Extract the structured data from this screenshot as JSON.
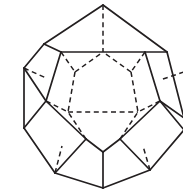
{
  "figure": {
    "shape_name": "dodecahedron",
    "view": "face-on front pentagon view",
    "background_color": "#ffffff",
    "line_color": "#231f20",
    "visible_edge_style": "solid",
    "hidden_edge_style": "dashed",
    "face_count": 12,
    "vertex_count": 20,
    "edge_count": 30,
    "canvas": {
      "width": 183,
      "height": 195
    },
    "clipping_note": "right silhouette extends past the right image border",
    "geometry": {
      "outer_silhouette": [
        [
          103,
          5
        ],
        [
          167,
          52
        ],
        [
          184,
          128
        ],
        [
          133,
          178
        ],
        [
          103,
          188
        ],
        [
          55,
          173
        ],
        [
          24,
          128
        ],
        [
          24,
          68
        ]
      ],
      "front_face_ring": [
        [
          103,
          52
        ],
        [
          145,
          84
        ],
        [
          129,
          133
        ],
        [
          77,
          133
        ],
        [
          61,
          84
        ]
      ],
      "visible_edges": [
        {
          "from": [
            103,
            5
          ],
          "to": [
            167,
            52
          ],
          "name": "silhouette-top-right"
        },
        {
          "from": [
            167,
            52
          ],
          "to": [
            184,
            118
          ],
          "name": "silhouette-right-upper"
        },
        {
          "from": [
            103,
            5
          ],
          "to": [
            44,
            44
          ],
          "name": "silhouette-top-left"
        },
        {
          "from": [
            44,
            44
          ],
          "to": [
            24,
            68
          ],
          "name": "silhouette-upper-left"
        },
        {
          "from": [
            24,
            68
          ],
          "to": [
            24,
            128
          ],
          "name": "silhouette-left-vertical"
        },
        {
          "from": [
            24,
            128
          ],
          "to": [
            55,
            173
          ],
          "name": "silhouette-lower-left"
        },
        {
          "from": [
            55,
            173
          ],
          "to": [
            103,
            188
          ],
          "name": "silhouette-bottom-left"
        },
        {
          "from": [
            103,
            188
          ],
          "to": [
            150,
            170
          ],
          "name": "silhouette-bottom-right"
        },
        {
          "from": [
            150,
            170
          ],
          "to": [
            184,
            130
          ],
          "name": "silhouette-right-lower"
        },
        {
          "from": [
            61,
            52
          ],
          "to": [
            145,
            52
          ],
          "name": "front-pentagon-top"
        },
        {
          "from": [
            145,
            52
          ],
          "to": [
            160,
            101
          ],
          "name": "front-pentagon-upper-right"
        },
        {
          "from": [
            160,
            101
          ],
          "to": [
            120,
            139
          ],
          "name": "front-pentagon-lower-right"
        },
        {
          "from": [
            120,
            139
          ],
          "to": [
            103,
            152
          ],
          "name": "front-pentagon-bottom-right"
        },
        {
          "from": [
            103,
            152
          ],
          "to": [
            86,
            139
          ],
          "name": "front-pentagon-bottom-left"
        },
        {
          "from": [
            86,
            139
          ],
          "to": [
            46,
            101
          ],
          "name": "front-pentagon-lower-left"
        },
        {
          "from": [
            46,
            101
          ],
          "to": [
            61,
            52
          ],
          "name": "front-pentagon-upper-left"
        },
        {
          "from": [
            44,
            44
          ],
          "to": [
            61,
            52
          ],
          "name": "connector-upper-left"
        },
        {
          "from": [
            167,
            52
          ],
          "to": [
            145,
            52
          ],
          "name": "connector-upper-right"
        },
        {
          "from": [
            24,
            68
          ],
          "to": [
            46,
            101
          ],
          "name": "connector-left-upper"
        },
        {
          "from": [
            24,
            128
          ],
          "to": [
            46,
            101
          ],
          "name": "connector-left-lower"
        },
        {
          "from": [
            55,
            173
          ],
          "to": [
            86,
            139
          ],
          "name": "connector-lower-left"
        },
        {
          "from": [
            103,
            188
          ],
          "to": [
            103,
            152
          ],
          "name": "connector-bottom"
        },
        {
          "from": [
            150,
            170
          ],
          "to": [
            120,
            139
          ],
          "name": "connector-lower-right"
        },
        {
          "from": [
            184,
            118
          ],
          "to": [
            160,
            101
          ],
          "name": "connector-right-upper"
        },
        {
          "from": [
            184,
            130
          ],
          "to": [
            160,
            101
          ],
          "name": "connector-right-lower"
        }
      ],
      "hidden_edges": [
        {
          "from": [
            103,
            5
          ],
          "to": [
            103,
            52
          ],
          "name": "hidden-top-spoke"
        },
        {
          "from": [
            61,
            52
          ],
          "to": [
            75,
            72
          ],
          "name": "hidden-upper-left-spoke"
        },
        {
          "from": [
            145,
            52
          ],
          "to": [
            131,
            72
          ],
          "name": "hidden-upper-right-spoke"
        },
        {
          "from": [
            75,
            72
          ],
          "to": [
            103,
            52
          ],
          "name": "hidden-back-pentagon-upper-left"
        },
        {
          "from": [
            131,
            72
          ],
          "to": [
            103,
            52
          ],
          "name": "hidden-back-pentagon-upper-right"
        },
        {
          "from": [
            75,
            72
          ],
          "to": [
            68,
            112
          ],
          "name": "hidden-back-pentagon-left"
        },
        {
          "from": [
            131,
            72
          ],
          "to": [
            138,
            112
          ],
          "name": "hidden-back-pentagon-right"
        },
        {
          "from": [
            68,
            112
          ],
          "to": [
            138,
            112
          ],
          "name": "hidden-back-pentagon-bottom"
        },
        {
          "from": [
            46,
            101
          ],
          "to": [
            68,
            112
          ],
          "name": "hidden-left-spoke"
        },
        {
          "from": [
            160,
            101
          ],
          "to": [
            138,
            112
          ],
          "name": "hidden-right-spoke"
        },
        {
          "from": [
            86,
            139
          ],
          "to": [
            68,
            112
          ],
          "name": "hidden-lower-left-spoke"
        },
        {
          "from": [
            120,
            139
          ],
          "to": [
            138,
            112
          ],
          "name": "hidden-lower-right-spoke"
        },
        {
          "from": [
            24,
            68
          ],
          "to": [
            46,
            78
          ],
          "name": "hidden-left-upper-stub"
        },
        {
          "from": [
            46,
            78
          ],
          "to": [
            61,
            52
          ],
          "name": "hidden-left-upper-stub-b"
        },
        {
          "from": [
            184,
            72
          ],
          "to": [
            160,
            80
          ],
          "name": "hidden-right-upper-stub"
        },
        {
          "from": [
            160,
            80
          ],
          "to": [
            145,
            52
          ],
          "name": "hidden-right-upper-stub-b"
        },
        {
          "from": [
            55,
            173
          ],
          "to": [
            62,
            146
          ],
          "name": "hidden-lower-left-stub"
        },
        {
          "from": [
            62,
            146
          ],
          "to": [
            86,
            139
          ],
          "name": "hidden-lower-left-stub-b"
        },
        {
          "from": [
            150,
            170
          ],
          "to": [
            143,
            146
          ],
          "name": "hidden-lower-right-stub"
        },
        {
          "from": [
            143,
            146
          ],
          "to": [
            120,
            139
          ],
          "name": "hidden-lower-right-stub-b"
        }
      ]
    }
  }
}
